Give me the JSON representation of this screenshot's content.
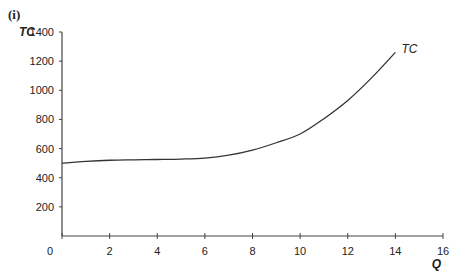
{
  "panel_label": "(i)",
  "chart_data": {
    "type": "line",
    "title": "",
    "xlabel": "Q",
    "ylabel": "TC",
    "xlim": [
      0,
      16
    ],
    "ylim": [
      0,
      1400
    ],
    "xticks": [
      0,
      2,
      4,
      6,
      8,
      10,
      12,
      14,
      16
    ],
    "yticks": [
      200,
      400,
      600,
      800,
      1000,
      1200,
      1400
    ],
    "origin_label": "0",
    "grid": false,
    "series": [
      {
        "name": "TC",
        "x": [
          0,
          1,
          2,
          3,
          4,
          5,
          6,
          7,
          8,
          9,
          10,
          11,
          12,
          13,
          14
        ],
        "y": [
          500,
          512,
          520,
          523,
          525,
          528,
          535,
          555,
          590,
          640,
          700,
          805,
          930,
          1085,
          1260
        ]
      }
    ]
  }
}
